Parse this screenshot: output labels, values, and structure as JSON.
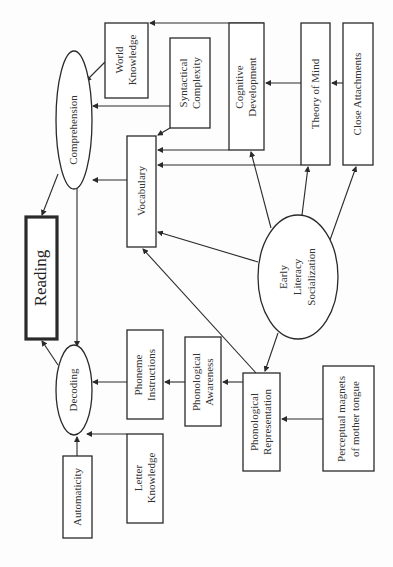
{
  "diagram": {
    "nodes": {
      "reading": {
        "label": "Reading"
      },
      "comprehension": {
        "label": "Comprehension"
      },
      "decoding": {
        "label": "Decoding"
      },
      "world_knowledge": {
        "line1": "World",
        "line2": "Knowledge"
      },
      "syntactical_complexity": {
        "line1": "Syntactical",
        "line2": "Complexity"
      },
      "cognitive_development": {
        "line1": "Cognitive",
        "line2": "Development"
      },
      "theory_of_mind": {
        "label": "Theory of Mind"
      },
      "close_attachments": {
        "label": "Close Attachments"
      },
      "vocabulary": {
        "label": "Vocabulary"
      },
      "early_literacy_socialization": {
        "line1": "Early",
        "line2": "Literacy",
        "line3": "Socialization"
      },
      "phoneme_instructions": {
        "line1": "Phoneme",
        "line2": "Instructions"
      },
      "phonological_awareness": {
        "line1": "Phonological",
        "line2": "Awareness"
      },
      "phonological_representation": {
        "line1": "Phonological",
        "line2": "Representation"
      },
      "perceptual_magnets": {
        "line1": "Perceptual magnets",
        "line2": "of mother tongue"
      },
      "automaticity": {
        "label": "Automaticity"
      },
      "letter_knowledge": {
        "line1": "Letter",
        "line2": "Knowledge"
      }
    },
    "edges": [
      {
        "from": "Comprehension",
        "to": "Reading"
      },
      {
        "from": "Decoding",
        "to": "Reading"
      },
      {
        "from": "Comprehension",
        "to": "Decoding",
        "bidirectional": true
      },
      {
        "from": "World Knowledge",
        "to": "Comprehension"
      },
      {
        "from": "Syntactical Complexity",
        "to": "Comprehension"
      },
      {
        "from": "Vocabulary",
        "to": "Comprehension"
      },
      {
        "from": "Cognitive Development",
        "to": "World Knowledge"
      },
      {
        "from": "Syntactical Complexity",
        "to": "Vocabulary"
      },
      {
        "from": "Cognitive Development",
        "to": "Vocabulary"
      },
      {
        "from": "Theory of Mind",
        "to": "Vocabulary"
      },
      {
        "from": "Theory of Mind",
        "to": "Cognitive Development"
      },
      {
        "from": "Close Attachments",
        "to": "Theory of Mind"
      },
      {
        "from": "Early Literacy Socialization",
        "to": "Vocabulary"
      },
      {
        "from": "Early Literacy Socialization",
        "to": "Cognitive Development"
      },
      {
        "from": "Early Literacy Socialization",
        "to": "Theory of Mind"
      },
      {
        "from": "Early Literacy Socialization",
        "to": "Close Attachments"
      },
      {
        "from": "Early Literacy Socialization",
        "to": "Phonological Representation"
      },
      {
        "from": "Phonological Representation",
        "to": "Vocabulary"
      },
      {
        "from": "Phonological Representation",
        "to": "Phonological Awareness"
      },
      {
        "from": "Phonological Awareness",
        "to": "Phoneme Instructions"
      },
      {
        "from": "Phoneme Instructions",
        "to": "Decoding"
      },
      {
        "from": "Perceptual magnets of mother tongue",
        "to": "Phonological Representation"
      },
      {
        "from": "Letter Knowledge",
        "to": "Decoding"
      },
      {
        "from": "Automaticity",
        "to": "Decoding"
      }
    ]
  }
}
